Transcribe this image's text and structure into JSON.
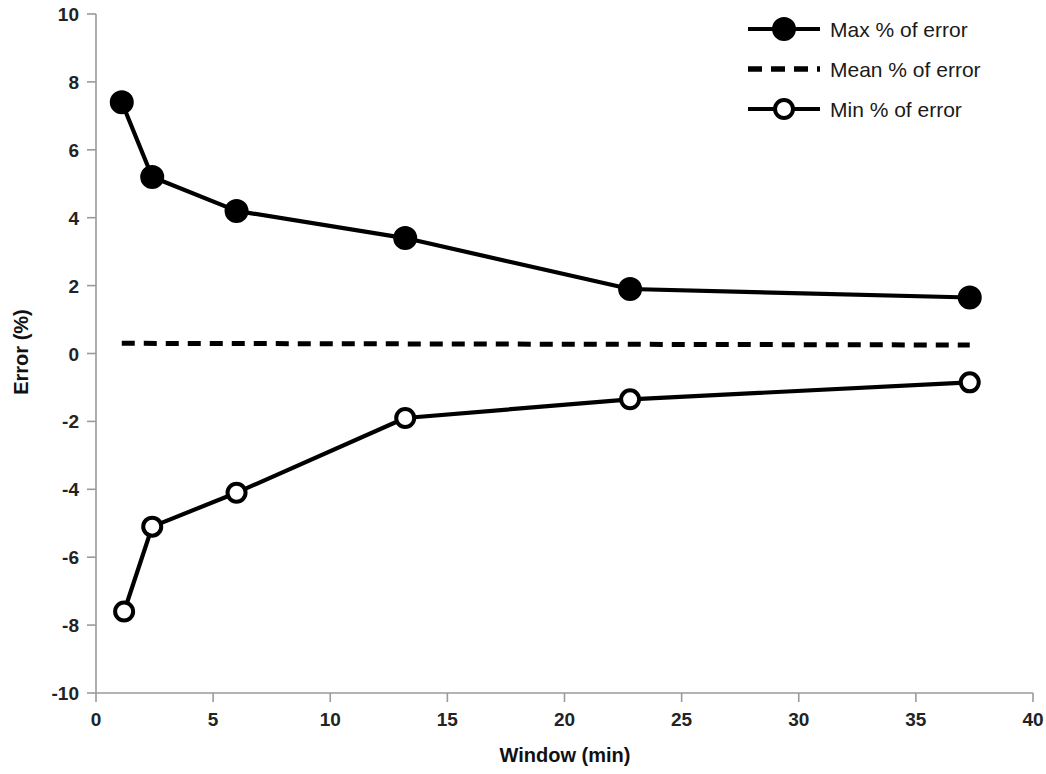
{
  "chart_data": {
    "type": "line",
    "title": "",
    "xlabel": "Window (min)",
    "ylabel": "Error (%)",
    "xlim": [
      0,
      40
    ],
    "ylim": [
      -10,
      10
    ],
    "xticks": [
      0,
      5,
      10,
      15,
      20,
      25,
      30,
      35,
      40
    ],
    "yticks": [
      -10,
      -8,
      -6,
      -4,
      -2,
      0,
      2,
      4,
      6,
      8,
      10
    ],
    "xtick_labels": [
      "0",
      "5",
      "10",
      "15",
      "20",
      "25",
      "30",
      "35",
      "40"
    ],
    "ytick_labels": [
      "-10",
      "-8",
      "-6",
      "-4",
      "-2",
      "0",
      "2",
      "4",
      "6",
      "8",
      "10"
    ],
    "grid": false,
    "legend_position": "top-right",
    "series": [
      {
        "name": "Max % of error",
        "marker": "filled-circle",
        "linestyle": "solid",
        "color": "#000000",
        "x": [
          1.1,
          2.4,
          6.0,
          13.2,
          22.8,
          37.3
        ],
        "values": [
          7.4,
          5.2,
          4.2,
          3.4,
          1.9,
          1.65
        ]
      },
      {
        "name": "Mean % of error",
        "marker": "none",
        "linestyle": "dashed",
        "color": "#000000",
        "x": [
          1.1,
          37.3
        ],
        "values": [
          0.3,
          0.25
        ]
      },
      {
        "name": "Min % of error",
        "marker": "open-circle",
        "linestyle": "solid",
        "color": "#000000",
        "x": [
          1.2,
          2.4,
          6.0,
          13.2,
          22.8,
          37.3
        ],
        "values": [
          -7.6,
          -5.1,
          -4.1,
          -1.9,
          -1.35,
          -0.85
        ]
      }
    ],
    "legend": [
      {
        "label": "Max % of error",
        "marker": "filled-circle",
        "linestyle": "solid"
      },
      {
        "label": "Mean % of error",
        "marker": "none",
        "linestyle": "dashed"
      },
      {
        "label": "Min % of error",
        "marker": "open-circle",
        "linestyle": "solid"
      }
    ]
  }
}
